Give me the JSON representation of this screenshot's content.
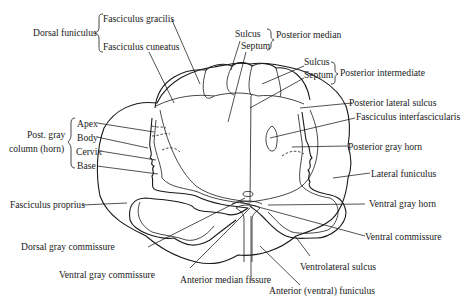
{
  "diagram": {
    "labels": {
      "dorsal_funiculus": "Dorsal funiculus",
      "fasciculus_gracilis": "Fasciculus gracilis",
      "fasciculus_cuneatus": "Fasciculus cuneatus",
      "sulcus_median": "Sulcus",
      "septum_median": "Septum",
      "posterior_median": "Posterior median",
      "sulcus_intermediate": "Sulcus",
      "septum_intermediate": "Septum",
      "posterior_intermediate": "Posterior intermediate",
      "posterior_lateral_sulcus": "Posterior lateral sulcus",
      "fasciculus_interfascicularis": "Fasciculus interfascicularis",
      "posterior_gray_horn": "Posterior gray horn",
      "lateral_funiculus": "Lateral funiculus",
      "ventral_gray_horn": "Ventral gray horn",
      "ventral_commissure": "Ventral commissure",
      "ventrolateral_sulcus": "Ventrolateral sulcus",
      "anterior_ventral_funiculus": "Anterior (ventral) funiculus",
      "anterior_median_fissure": "Anterior median fissure",
      "ventral_gray_commissure": "Ventral gray commissure",
      "dorsal_gray_commissure": "Dorsal gray commissure",
      "fasciculus_proprius": "Fasciculus proprius",
      "post_gray_column_line1": "Post. gray",
      "post_gray_column_line2": "column (horn)",
      "apex": "Apex",
      "body": "Body",
      "cervix": "Cervix",
      "base": "Base"
    }
  }
}
